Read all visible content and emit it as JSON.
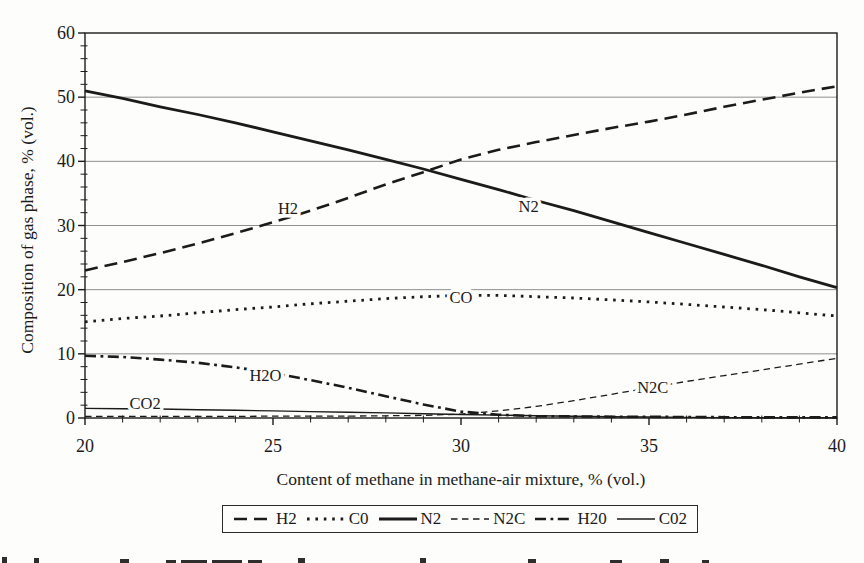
{
  "figure": {
    "x_axis_title": "Content of methane in methane-air mixture, % (vol.)",
    "y_axis_title": "Composition of gas phase, % (vol.)"
  },
  "colors": {
    "background": "#fdfdfc",
    "line": "#1b1b1b",
    "grid": "#8f8f8f",
    "text": "#1b1b1b"
  },
  "chart_data": {
    "type": "line",
    "title": "",
    "xlabel": "Content of methane in methane-air mixture, % (vol.)",
    "ylabel": "Composition of gas phase, % (vol.)",
    "xlim": [
      20,
      40
    ],
    "ylim": [
      0,
      60
    ],
    "x_major_ticks": [
      20,
      25,
      30,
      35,
      40
    ],
    "x_minor_step": 1,
    "y_major_ticks": [
      0,
      10,
      20,
      30,
      40,
      50,
      60
    ],
    "y_minor_step": 2,
    "grid": "horizontal major gridlines only",
    "legend_position": "bottom",
    "x": [
      20,
      21,
      22,
      23,
      24,
      25,
      26,
      27,
      28,
      29,
      30,
      31,
      32,
      33,
      34,
      35,
      36,
      37,
      38,
      39,
      40
    ],
    "series": [
      {
        "name": "H2",
        "legend_label": "H2",
        "style": "thick-dashed",
        "values": [
          23.0,
          24.3,
          25.7,
          27.2,
          28.8,
          30.5,
          32.3,
          34.3,
          36.4,
          38.3,
          40.3,
          41.8,
          43.0,
          44.1,
          45.2,
          46.2,
          47.3,
          48.5,
          49.6,
          50.7,
          51.7
        ],
        "annotation": {
          "text": "H2",
          "x": 25.4,
          "y": 32.6
        }
      },
      {
        "name": "CO",
        "legend_label": "C0",
        "style": "dotted",
        "values": [
          15.0,
          15.5,
          15.9,
          16.4,
          16.9,
          17.3,
          17.8,
          18.2,
          18.6,
          18.9,
          19.1,
          19.1,
          18.9,
          18.7,
          18.4,
          18.1,
          17.7,
          17.3,
          16.9,
          16.4,
          15.9
        ],
        "annotation": {
          "text": "CO",
          "x": 30.0,
          "y": 18.8
        }
      },
      {
        "name": "N2",
        "legend_label": "N2",
        "style": "thick-solid",
        "values": [
          51.0,
          49.8,
          48.5,
          47.3,
          46.0,
          44.6,
          43.2,
          41.8,
          40.3,
          38.8,
          37.2,
          35.6,
          33.9,
          32.3,
          30.6,
          28.9,
          27.2,
          25.5,
          23.8,
          22.0,
          20.3
        ],
        "annotation": {
          "text": "N2",
          "x": 31.8,
          "y": 32.9
        }
      },
      {
        "name": "N2C",
        "legend_label": "N2C",
        "style": "thin-dashed",
        "values": [
          0.25,
          0.25,
          0.25,
          0.25,
          0.25,
          0.3,
          0.3,
          0.3,
          0.35,
          0.4,
          0.6,
          1.1,
          1.8,
          2.7,
          3.7,
          4.7,
          5.7,
          6.6,
          7.5,
          8.4,
          9.3
        ],
        "annotation": {
          "text": "N2C",
          "x": 35.1,
          "y": 4.8
        }
      },
      {
        "name": "H2O",
        "legend_label": "H20",
        "style": "dash-dot",
        "values": [
          9.7,
          9.5,
          9.1,
          8.6,
          7.9,
          7.0,
          5.9,
          4.7,
          3.4,
          2.1,
          1.0,
          0.5,
          0.3,
          0.25,
          0.2,
          0.18,
          0.15,
          0.12,
          0.1,
          0.1,
          0.1
        ],
        "annotation": {
          "text": "H2O",
          "x": 24.8,
          "y": 6.7
        }
      },
      {
        "name": "CO2",
        "legend_label": "C02",
        "style": "thin-solid",
        "values": [
          1.5,
          1.45,
          1.4,
          1.3,
          1.2,
          1.1,
          1.0,
          0.9,
          0.8,
          0.65,
          0.55,
          0.45,
          0.35,
          0.27,
          0.2,
          0.15,
          0.1,
          0.07,
          0.05,
          0.04,
          0.03
        ],
        "annotation": {
          "text": "CO2",
          "x": 21.6,
          "y": 2.2
        }
      }
    ]
  }
}
